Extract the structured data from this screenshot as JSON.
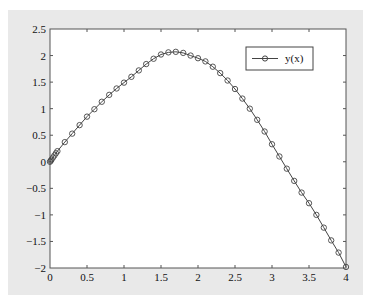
{
  "chart_data": {
    "type": "line",
    "title": "",
    "xlabel": "",
    "ylabel": "",
    "xlim": [
      0,
      4
    ],
    "ylim": [
      -2,
      2.5
    ],
    "grid": false,
    "legend_position": "upper right",
    "x_ticks": [
      "0",
      "0.5",
      "1",
      "1.5",
      "2",
      "2.5",
      "3",
      "3.5",
      "4"
    ],
    "y_ticks": [
      "2.5",
      "2",
      "1.5",
      "1",
      "0.5",
      "0",
      "-0.5",
      "-1",
      "-1.5",
      "-2"
    ],
    "series": [
      {
        "name": "y(x)",
        "marker": "circle",
        "color": "#333333",
        "x": [
          0,
          0.01,
          0.02,
          0.04,
          0.06,
          0.08,
          0.1,
          0.2,
          0.3,
          0.4,
          0.5,
          0.6,
          0.7,
          0.8,
          0.9,
          1.0,
          1.1,
          1.2,
          1.3,
          1.4,
          1.5,
          1.6,
          1.7,
          1.8,
          1.9,
          2.0,
          2.1,
          2.2,
          2.3,
          2.4,
          2.5,
          2.6,
          2.7,
          2.8,
          2.9,
          3.0,
          3.1,
          3.2,
          3.3,
          3.4,
          3.5,
          3.6,
          3.7,
          3.8,
          3.9,
          4.0
        ],
        "y": [
          0,
          0.02,
          0.04,
          0.08,
          0.12,
          0.16,
          0.2,
          0.37,
          0.53,
          0.69,
          0.85,
          0.99,
          1.13,
          1.26,
          1.38,
          1.49,
          1.6,
          1.72,
          1.84,
          1.94,
          2.02,
          2.06,
          2.07,
          2.05,
          2.0,
          1.95,
          1.89,
          1.79,
          1.67,
          1.53,
          1.37,
          1.19,
          1.0,
          0.79,
          0.57,
          0.33,
          0.1,
          -0.13,
          -0.36,
          -0.58,
          -0.78,
          -1.0,
          -1.24,
          -1.48,
          -1.71,
          -1.98
        ]
      }
    ]
  },
  "legend": {
    "label": "y(x)"
  }
}
